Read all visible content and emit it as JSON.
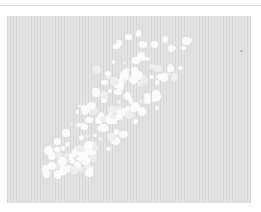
{
  "image": {
    "description": "Grayscale micrograph-style image: diagonal cluster of white blobs on a finely striped gray background",
    "caption": "",
    "colors": {
      "background": "#ffffff",
      "panel": "#dcdcdc",
      "stripe_dark": "#d6d6d6",
      "stripe_light": "#e4e4e4",
      "blob": "#fbfbfb",
      "top_rule": "#dedede"
    }
  }
}
